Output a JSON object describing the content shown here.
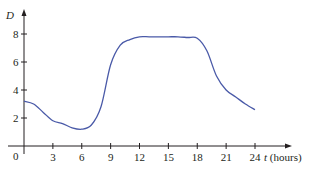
{
  "chart_data": {
    "type": "line",
    "title": "",
    "xlabel": "t (hours)",
    "ylabel": "D",
    "x_ticks": [
      0,
      3,
      6,
      9,
      12,
      15,
      18,
      21,
      24
    ],
    "y_ticks": [
      2,
      4,
      6,
      8
    ],
    "xlim": [
      0,
      24
    ],
    "ylim": [
      0,
      8.5
    ],
    "grid": false,
    "legend": null,
    "series": [
      {
        "name": "D(t)",
        "color": "#4a5aa8",
        "x": [
          0,
          1,
          2,
          3,
          4,
          5,
          6,
          7,
          8,
          9,
          10,
          11,
          12,
          13,
          14,
          15,
          16,
          17,
          18,
          19,
          20,
          21,
          22,
          23,
          24
        ],
        "values": [
          3.2,
          3.0,
          2.4,
          1.8,
          1.6,
          1.3,
          1.2,
          1.5,
          2.8,
          5.8,
          7.2,
          7.6,
          7.8,
          7.8,
          7.8,
          7.8,
          7.8,
          7.75,
          7.7,
          6.8,
          5.0,
          4.0,
          3.5,
          3.0,
          2.6
        ]
      }
    ]
  },
  "axes": {
    "x_label_var": "t",
    "x_label_unit": "(hours)",
    "y_label_var": "D",
    "origin_label": "0",
    "x_tick_labels": [
      "3",
      "6",
      "9",
      "12",
      "15",
      "18",
      "21",
      "24"
    ],
    "y_tick_labels": [
      "2",
      "4",
      "6",
      "8"
    ]
  },
  "colors": {
    "axis": "#231f20",
    "curve": "#4a5aa8"
  }
}
